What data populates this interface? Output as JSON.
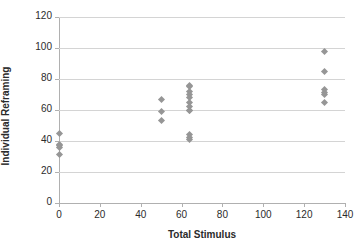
{
  "chart_data": {
    "type": "scatter",
    "title": "",
    "xlabel": "Total Stimulus",
    "ylabel": "Individual Reframing",
    "xlim": [
      0,
      140
    ],
    "ylim": [
      0,
      120
    ],
    "xticks": [
      0,
      20,
      40,
      60,
      80,
      100,
      120,
      140
    ],
    "yticks": [
      0,
      20,
      40,
      60,
      80,
      100,
      120
    ],
    "xtick_labels": [
      "0",
      "20",
      "40",
      "60",
      "80",
      "100",
      "120",
      "140"
    ],
    "ytick_labels": [
      "0",
      "20",
      "40",
      "60",
      "80",
      "100",
      "120"
    ],
    "grid": "horizontal",
    "legend": "none",
    "marker_color": "#969696",
    "marker_shape": "diamond",
    "gridline_color": "#d4d4d4",
    "axis_color": "#b0b0b0",
    "background_color": "#ffffff",
    "points": [
      {
        "x": 0,
        "y": 45
      },
      {
        "x": 0,
        "y": 38
      },
      {
        "x": 0,
        "y": 37
      },
      {
        "x": 0,
        "y": 36
      },
      {
        "x": 0,
        "y": 31
      },
      {
        "x": 50,
        "y": 67
      },
      {
        "x": 50,
        "y": 59
      },
      {
        "x": 50,
        "y": 53.5
      },
      {
        "x": 64,
        "y": 76
      },
      {
        "x": 64,
        "y": 75
      },
      {
        "x": 64,
        "y": 72
      },
      {
        "x": 64,
        "y": 70
      },
      {
        "x": 64,
        "y": 68
      },
      {
        "x": 64,
        "y": 65
      },
      {
        "x": 64,
        "y": 62
      },
      {
        "x": 64,
        "y": 60
      },
      {
        "x": 64,
        "y": 59.5
      },
      {
        "x": 64,
        "y": 44
      },
      {
        "x": 64,
        "y": 42
      },
      {
        "x": 64,
        "y": 41
      },
      {
        "x": 130,
        "y": 98
      },
      {
        "x": 130,
        "y": 85
      },
      {
        "x": 130,
        "y": 73
      },
      {
        "x": 130,
        "y": 71
      },
      {
        "x": 130,
        "y": 70
      },
      {
        "x": 130,
        "y": 65
      }
    ]
  }
}
